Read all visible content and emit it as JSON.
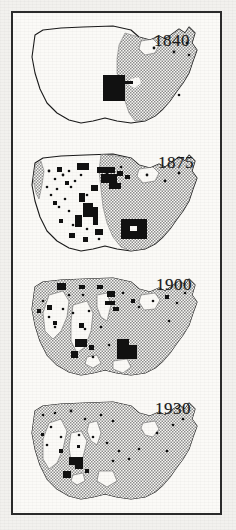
{
  "figure": {
    "kind": "historical-map-series",
    "border_color": "#2b2b2b",
    "page_color": "#f2f1ee",
    "plate_color": "#fbfaf7",
    "shaded_color": "#8e8e8e",
    "solid_color": "#111111",
    "outline_color": "#1a1a1a",
    "ghost_text": "lum\nllect\nhad"
  },
  "legend": {
    "shaded_meaning": "settled area",
    "solid_meaning": "dense settlement",
    "unshaded_meaning": "unsettled area"
  },
  "maps": [
    {
      "year": "1840",
      "label_x": 141,
      "label_y": 14,
      "shaded_fraction": 0.3,
      "solid_patches": 1,
      "dot_count": 5
    },
    {
      "year": "1875",
      "label_x": 145,
      "label_y": 12,
      "shaded_fraction": 0.48,
      "solid_patches": 26,
      "dot_count": 22
    },
    {
      "year": "1900",
      "label_x": 143,
      "label_y": 10,
      "shaded_fraction": 0.72,
      "solid_patches": 20,
      "dot_count": 18
    },
    {
      "year": "1930",
      "label_x": 142,
      "label_y": 10,
      "shaded_fraction": 0.9,
      "solid_patches": 6,
      "dot_count": 20
    }
  ]
}
